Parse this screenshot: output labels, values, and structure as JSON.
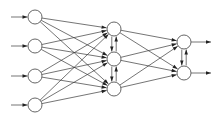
{
  "diagram": {
    "type": "neural-network",
    "title": "",
    "colors": {
      "node_stroke": "#555555",
      "node_fill": "#ffffff",
      "edge": "#3a3a3a",
      "background": "#ffffff"
    },
    "node_radius": 7,
    "layers": [
      {
        "name": "input",
        "nodes": [
          {
            "id": "i1",
            "x": 35,
            "y": 17
          },
          {
            "id": "i2",
            "x": 35,
            "y": 46
          },
          {
            "id": "i3",
            "x": 35,
            "y": 76
          },
          {
            "id": "i4",
            "x": 35,
            "y": 105
          }
        ]
      },
      {
        "name": "hidden",
        "nodes": [
          {
            "id": "h1",
            "x": 114,
            "y": 29
          },
          {
            "id": "h2",
            "x": 114,
            "y": 59
          },
          {
            "id": "h3",
            "x": 114,
            "y": 89
          }
        ]
      },
      {
        "name": "output",
        "nodes": [
          {
            "id": "o1",
            "x": 184,
            "y": 42
          },
          {
            "id": "o2",
            "x": 184,
            "y": 73
          }
        ]
      }
    ],
    "external_inputs": [
      {
        "to": "i1",
        "from_x": 11
      },
      {
        "to": "i2",
        "from_x": 11
      },
      {
        "to": "i3",
        "from_x": 11
      },
      {
        "to": "i4",
        "from_x": 11
      }
    ],
    "external_outputs": [
      {
        "from": "o1",
        "to_x": 211
      },
      {
        "from": "o2",
        "to_x": 211
      }
    ],
    "feedforward": [
      [
        "i1",
        "h1"
      ],
      [
        "i1",
        "h2"
      ],
      [
        "i1",
        "h3"
      ],
      [
        "i2",
        "h1"
      ],
      [
        "i2",
        "h2"
      ],
      [
        "i2",
        "h3"
      ],
      [
        "i3",
        "h1"
      ],
      [
        "i3",
        "h2"
      ],
      [
        "i3",
        "h3"
      ],
      [
        "i4",
        "h1"
      ],
      [
        "i4",
        "h2"
      ],
      [
        "i4",
        "h3"
      ],
      [
        "h1",
        "o1"
      ],
      [
        "h1",
        "o2"
      ],
      [
        "h2",
        "o1"
      ],
      [
        "h2",
        "o2"
      ],
      [
        "h3",
        "o1"
      ],
      [
        "h3",
        "o2"
      ]
    ],
    "lateral": [
      {
        "a": "h1",
        "b": "h2"
      },
      {
        "a": "h2",
        "b": "h3"
      },
      {
        "a": "o1",
        "b": "o2"
      }
    ]
  }
}
